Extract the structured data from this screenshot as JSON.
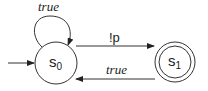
{
  "diagram": {
    "type": "buchi-automaton",
    "states": [
      {
        "id": "s0",
        "label": "s",
        "subscript": "0",
        "initial": true,
        "accepting": false
      },
      {
        "id": "s1",
        "label": "s",
        "subscript": "1",
        "initial": false,
        "accepting": true
      }
    ],
    "transitions": [
      {
        "from": "s0",
        "to": "s0",
        "label": "true"
      },
      {
        "from": "s0",
        "to": "s1",
        "label": "!p"
      },
      {
        "from": "s1",
        "to": "s0",
        "label": "true"
      }
    ],
    "colors": {
      "stroke": "#333333",
      "background": "#ffffff"
    }
  }
}
